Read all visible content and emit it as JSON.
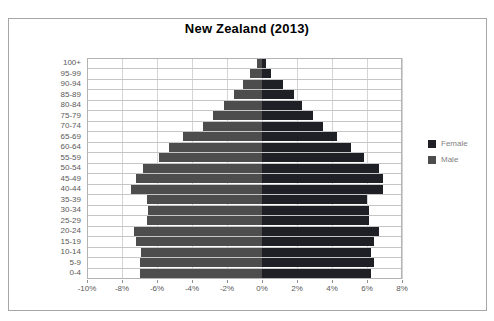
{
  "figure": {
    "title": "New Zealand (2013)"
  },
  "legend": {
    "items": [
      {
        "label": "Female",
        "color": "#1f1f26"
      },
      {
        "label": "Male",
        "color": "#4d4d4d"
      }
    ]
  },
  "chart_data": {
    "type": "bar",
    "subtype": "population-pyramid",
    "title": "New Zealand (2013)",
    "orientation": "horizontal",
    "categories": [
      "100+",
      "95-99",
      "90-94",
      "85-89",
      "80-84",
      "75-79",
      "70-74",
      "65-69",
      "60-64",
      "55-59",
      "50-54",
      "45-49",
      "40-44",
      "35-39",
      "30-34",
      "25-29",
      "20-24",
      "15-19",
      "10-14",
      "5-9",
      "0-4"
    ],
    "series": [
      {
        "name": "Male",
        "side": "left",
        "color": "#4d4d4d",
        "unit": "% of population",
        "values": [
          0.3,
          0.7,
          1.1,
          1.6,
          2.2,
          2.8,
          3.4,
          4.5,
          5.3,
          5.9,
          6.8,
          7.2,
          7.5,
          6.6,
          6.5,
          6.6,
          7.3,
          7.2,
          6.9,
          7.0,
          7.0
        ]
      },
      {
        "name": "Female",
        "side": "right",
        "color": "#1f1f26",
        "unit": "% of population",
        "values": [
          0.2,
          0.5,
          1.2,
          1.8,
          2.3,
          2.9,
          3.5,
          4.3,
          5.1,
          5.8,
          6.7,
          6.9,
          6.9,
          6.0,
          6.1,
          6.1,
          6.7,
          6.4,
          6.2,
          6.4,
          6.2
        ]
      }
    ],
    "xlabel": "",
    "ylabel": "",
    "xlim": [
      -10,
      8
    ],
    "x_tick_values": [
      -10,
      -8,
      -6,
      -4,
      -2,
      0,
      2,
      4,
      6,
      8
    ],
    "x_ticks": [
      "-10%",
      "-8%",
      "-6%",
      "-4%",
      "-2%",
      "0%",
      "2%",
      "4%",
      "6%",
      "8%"
    ],
    "grid": true,
    "legend_position": "right"
  }
}
